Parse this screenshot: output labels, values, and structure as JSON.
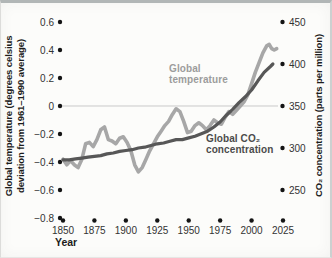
{
  "figure": {
    "xlabel": "Year"
  },
  "chart_data": {
    "type": "line",
    "title": "",
    "xlabel": "Year",
    "x_axis": {
      "range": [
        1850,
        2025
      ],
      "ticks": [
        1850,
        1875,
        1900,
        1925,
        1950,
        1975,
        2000,
        2025
      ]
    },
    "left_axis": {
      "label": "Global temperature (degrees celsius deviation from 1961–1990 average)",
      "label_line1": "Global temperature (degrees celsius",
      "label_line2": "deviation from 1961–1990 average)",
      "range": [
        -0.8,
        0.6
      ],
      "tick_values": [
        0.6,
        0.4,
        0.2,
        0,
        -0.2,
        -0.4,
        -0.6,
        -0.8
      ],
      "tick_labels": [
        "0.6",
        "0.4",
        "0.2",
        "0",
        "−0.2",
        "−0.4",
        "−0.6",
        "−0.8"
      ]
    },
    "right_axis": {
      "label": "CO₂ concentration (parts per million)",
      "tick_values": [
        450,
        400,
        350,
        300,
        250
      ],
      "tick_labels": [
        "450",
        "400",
        "350",
        "300",
        "250"
      ]
    },
    "baseline": {
      "left_value": 0,
      "right_value": 350,
      "color": "#c9c9c9"
    },
    "grid": "off",
    "legend_position": "inline-annotations",
    "annotations": [
      {
        "series": "Global temperature",
        "line1": "Global",
        "line2": "temperature",
        "color": "#9c9c9c"
      },
      {
        "series": "Global CO₂ concentration",
        "line1": "Global CO₂",
        "line2": "concentration",
        "color": "#4b4b4b"
      }
    ],
    "colors": {
      "temperature_line": "#a7a7a7",
      "co2_line": "#575757",
      "tick_dot": "#141414",
      "tick_text": "#333333"
    },
    "series": [
      {
        "name": "Global temperature",
        "axis": "left",
        "unit": "°C deviation from 1961–1990 average",
        "color": "#a7a7a7",
        "data": [
          [
            1850,
            -0.38
          ],
          [
            1853,
            -0.42
          ],
          [
            1856,
            -0.39
          ],
          [
            1859,
            -0.42
          ],
          [
            1862,
            -0.44
          ],
          [
            1865,
            -0.38
          ],
          [
            1868,
            -0.27
          ],
          [
            1871,
            -0.26
          ],
          [
            1874,
            -0.29
          ],
          [
            1877,
            -0.24
          ],
          [
            1880,
            -0.17
          ],
          [
            1883,
            -0.15
          ],
          [
            1886,
            -0.24
          ],
          [
            1889,
            -0.25
          ],
          [
            1892,
            -0.27
          ],
          [
            1895,
            -0.23
          ],
          [
            1898,
            -0.22
          ],
          [
            1901,
            -0.26
          ],
          [
            1904,
            -0.32
          ],
          [
            1907,
            -0.42
          ],
          [
            1910,
            -0.47
          ],
          [
            1913,
            -0.44
          ],
          [
            1916,
            -0.38
          ],
          [
            1919,
            -0.32
          ],
          [
            1922,
            -0.27
          ],
          [
            1925,
            -0.22
          ],
          [
            1928,
            -0.18
          ],
          [
            1931,
            -0.14
          ],
          [
            1934,
            -0.11
          ],
          [
            1937,
            -0.06
          ],
          [
            1940,
            -0.02
          ],
          [
            1943,
            -0.04
          ],
          [
            1946,
            -0.11
          ],
          [
            1949,
            -0.19
          ],
          [
            1952,
            -0.18
          ],
          [
            1955,
            -0.14
          ],
          [
            1958,
            -0.12
          ],
          [
            1961,
            -0.14
          ],
          [
            1964,
            -0.17
          ],
          [
            1967,
            -0.14
          ],
          [
            1970,
            -0.1
          ],
          [
            1973,
            -0.12
          ],
          [
            1976,
            -0.13
          ],
          [
            1979,
            -0.08
          ],
          [
            1982,
            -0.04
          ],
          [
            1985,
            -0.06
          ],
          [
            1988,
            -0.03
          ],
          [
            1991,
            0.0
          ],
          [
            1994,
            0.03
          ],
          [
            1997,
            0.08
          ],
          [
            2000,
            0.16
          ],
          [
            2003,
            0.24
          ],
          [
            2006,
            0.31
          ],
          [
            2009,
            0.38
          ],
          [
            2012,
            0.43
          ],
          [
            2014,
            0.44
          ],
          [
            2016,
            0.41
          ],
          [
            2018,
            0.4
          ],
          [
            2020,
            0.41
          ]
        ]
      },
      {
        "name": "Global CO₂ concentration",
        "axis": "right",
        "unit": "parts per million",
        "color": "#575757",
        "data": [
          [
            1850,
            286
          ],
          [
            1855,
            286
          ],
          [
            1860,
            287
          ],
          [
            1865,
            288
          ],
          [
            1870,
            289
          ],
          [
            1875,
            290
          ],
          [
            1880,
            291
          ],
          [
            1885,
            293
          ],
          [
            1890,
            294
          ],
          [
            1895,
            296
          ],
          [
            1900,
            297
          ],
          [
            1905,
            298
          ],
          [
            1910,
            300
          ],
          [
            1915,
            301
          ],
          [
            1920,
            303
          ],
          [
            1925,
            305
          ],
          [
            1930,
            306
          ],
          [
            1935,
            308
          ],
          [
            1940,
            310
          ],
          [
            1945,
            310
          ],
          [
            1950,
            312
          ],
          [
            1955,
            314
          ],
          [
            1960,
            317
          ],
          [
            1965,
            320
          ],
          [
            1970,
            325
          ],
          [
            1975,
            331
          ],
          [
            1980,
            339
          ],
          [
            1985,
            346
          ],
          [
            1990,
            354
          ],
          [
            1995,
            361
          ],
          [
            2000,
            369
          ],
          [
            2005,
            380
          ],
          [
            2010,
            390
          ],
          [
            2015,
            397
          ],
          [
            2017,
            400
          ]
        ]
      }
    ]
  }
}
